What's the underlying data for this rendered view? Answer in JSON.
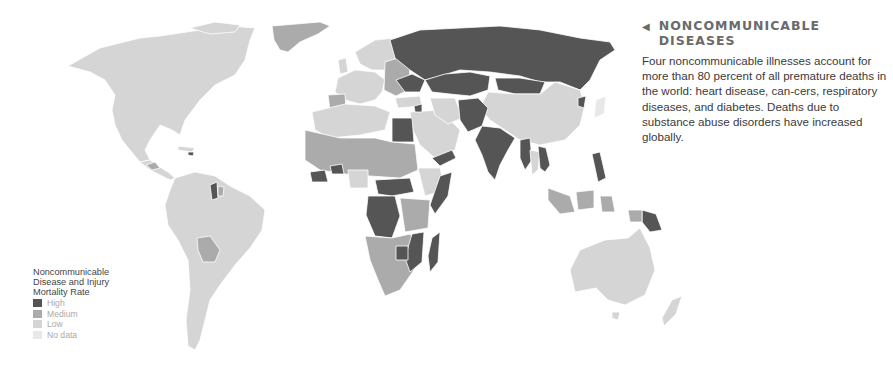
{
  "panel": {
    "arrow_icon": "◀",
    "heading_line1": "NONCOMMUNICABLE",
    "heading_line2": "DISEASES",
    "body": "Four noncommunicable illnesses account for more than 80 percent of all premature deaths in the world: heart disease, can-cers, respiratory diseases, and diabetes. Deaths due to substance abuse disorders have increased globally."
  },
  "legend": {
    "title": "Noncommunicable Disease and Injury Mortality Rate",
    "items": [
      {
        "label": "High",
        "color": "#555555"
      },
      {
        "label": "Medium",
        "color": "#ababab"
      },
      {
        "label": "Low",
        "color": "#d5d5d5"
      },
      {
        "label": "No data",
        "color": "#e8e8e8"
      }
    ]
  },
  "colors": {
    "high": "#555555",
    "medium": "#ababab",
    "low": "#d5d5d5",
    "nodata": "#e8e8e8"
  },
  "regions": {
    "high": [
      "Russia",
      "Kazakhstan",
      "Mongolia",
      "Central Asia",
      "Afghanistan",
      "Pakistan",
      "India",
      "Myanmar",
      "Egypt",
      "Yemen",
      "Somalia",
      "DR Congo",
      "Sudan",
      "Mozambique",
      "Madagascar",
      "Zimbabwe",
      "Papua New Guinea",
      "Philippines",
      "Guyana",
      "Ukraine",
      "Belarus"
    ],
    "medium": [
      "Greenland",
      "Bolivia",
      "West Africa",
      "Central Africa",
      "Southern Africa",
      "Indonesia",
      "Kenya",
      "Eastern Europe"
    ],
    "low": [
      "Canada",
      "United States",
      "Mexico",
      "South America",
      "China",
      "Australia",
      "Western Europe",
      "Saudi Arabia",
      "Ethiopia",
      "Algeria",
      "Libya",
      "Thailand"
    ]
  }
}
